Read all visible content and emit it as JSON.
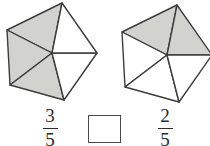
{
  "problem": {
    "type": "fraction-comparison",
    "shape": "pentagon-divided-into-fifths",
    "left": {
      "numerator": "3",
      "denominator": "5",
      "total_parts": 5,
      "shaded_parts": 3
    },
    "right": {
      "numerator": "2",
      "denominator": "5",
      "total_parts": 5,
      "shaded_parts": 2
    },
    "comparison_box": {
      "value": "",
      "placeholder": ""
    }
  },
  "colors": {
    "shaded_fill": "#d2d2ce",
    "unshaded_fill": "#ffffff",
    "stroke": "#3c3c3c",
    "text": "#2b2b2b"
  },
  "figures": {
    "left_label": "pentagon-three-fifths-shaded",
    "right_label": "pentagon-two-fifths-shaded"
  }
}
